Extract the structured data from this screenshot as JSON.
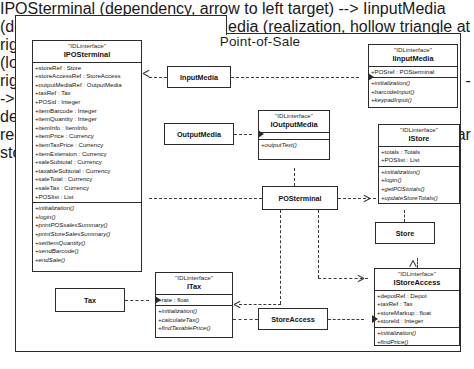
{
  "diagram": {
    "title": "Point-of-Sale",
    "stereotype": "\"IDLinterface\""
  },
  "classes": {
    "iposterminal": {
      "stereotype": "\"IDLinterface\"",
      "name": "IPOSterminal",
      "attributes": [
        "+storeRef : Store",
        "+storeAccessRef : StoreAccess",
        "+outputMediaRef : OutputMedia",
        "+taxRef : Tax",
        "+POSid : Integer",
        "+itemBarcode : Integer",
        "+itemQuantity : Integer",
        "+itemInfo : ItemInfo",
        "+itemPrice : Currency",
        "+itemTaxPrice : Currency",
        "+itemExtension : Currency",
        "+saleSubtotal : Currency",
        "+taxableSubtotal : Currency",
        "+saleTotal : Currency",
        "+saleTax : Currency",
        "+POSlist : List"
      ],
      "operations": [
        "+initialization()",
        "+login()",
        "+printPOSsalesSummary()",
        "+printStoreSalesSummary()",
        "+setItemQuantity()",
        "+sendBarcode()",
        "+endSale()"
      ]
    },
    "iinputmedia": {
      "stereotype": "\"IDLinterface\"",
      "name": "IinputMedia",
      "attributes": [
        "+POSref : POSterminal"
      ],
      "operations": [
        "+initialization()",
        "+barcodeInput()",
        "+keypadInput()"
      ]
    },
    "ioutputmedia": {
      "stereotype": "\"IDLinterface\"",
      "name": "IOutputMedia",
      "attributes": [],
      "operations": [
        "+outputText()"
      ]
    },
    "istore": {
      "stereotype": "\"IDLinterface\"",
      "name": "IStore",
      "attributes": [
        "+totals : Totals",
        "+POSlist : List"
      ],
      "operations": [
        "+initialization()",
        "+login()",
        "+getPOStotals()",
        "+updateStoreTotals()"
      ]
    },
    "istoreaccess": {
      "stereotype": "\"IDLinterface\"",
      "name": "IStoreAccess",
      "attributes": [
        "+depotRef : Depot",
        "+taxRef : Tax",
        "+storeMarkup : float",
        "+storeId : Integer"
      ],
      "operations": [
        "+initialization()",
        "+findPrice()"
      ]
    },
    "itax": {
      "stereotype": "\"IDLinterface\"",
      "name": "ITax",
      "attributes": [
        "+rate : float"
      ],
      "operations": [
        "+initialization()",
        "+calculateTax()",
        "+findTaxablePrice()"
      ]
    }
  },
  "components": {
    "input_media": "InputMedia",
    "output_media": "OutputMedia",
    "posterminal": "POSterminal",
    "store": "Store",
    "store_access": "StoreAccess",
    "tax": "Tax"
  }
}
